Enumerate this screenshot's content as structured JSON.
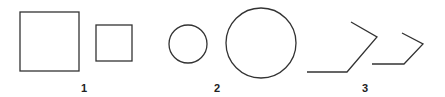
{
  "figure": {
    "groups": [
      {
        "label": "1",
        "label_pos": [
          84,
          92
        ],
        "shapes": [
          {
            "type": "square",
            "name": "large-square",
            "x": 20,
            "y": 12,
            "w": 59,
            "h": 59
          },
          {
            "type": "square",
            "name": "small-square",
            "x": 96,
            "y": 25,
            "w": 36,
            "h": 36
          }
        ]
      },
      {
        "label": "2",
        "label_pos": [
          217,
          92
        ],
        "shapes": [
          {
            "type": "circle",
            "name": "small-circle",
            "cx": 188,
            "cy": 44,
            "r": 19
          },
          {
            "type": "circle",
            "name": "large-circle",
            "cx": 261,
            "cy": 43,
            "r": 35
          }
        ]
      },
      {
        "label": "3",
        "label_pos": [
          365,
          92
        ],
        "shapes": [
          {
            "type": "polyline",
            "name": "large-polyline",
            "points": "307,72 347,72 377,37 351,22"
          },
          {
            "type": "polyline",
            "name": "small-polyline",
            "points": "372,64 404,64 423,44 402,33"
          }
        ]
      }
    ],
    "stroke_color": "#333333",
    "label_color": "#222222"
  }
}
